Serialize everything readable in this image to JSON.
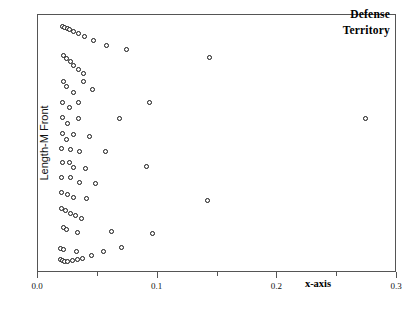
{
  "chart_data": {
    "type": "scatter",
    "title": "",
    "annotation_lines": [
      "Defense",
      "Territory"
    ],
    "xlabel": "x-axis",
    "ylabel": "Length-M Front",
    "xlim": [
      0.0,
      0.3
    ],
    "ylim": [
      0.0,
      1.0
    ],
    "grid": false,
    "legend": null,
    "x_ticks": [
      {
        "value": 0.0,
        "label": "0.0",
        "type": "major"
      },
      {
        "value": 0.05,
        "label": "",
        "type": "minor"
      },
      {
        "value": 0.1,
        "label": "0.1",
        "type": "major"
      },
      {
        "value": 0.15,
        "label": "",
        "type": "minor"
      },
      {
        "value": 0.2,
        "label": "0.2",
        "type": "major"
      },
      {
        "value": 0.25,
        "label": "",
        "type": "minor"
      },
      {
        "value": 0.3,
        "label": "0.3",
        "type": "major"
      }
    ],
    "y_ticks": [],
    "marker": {
      "shape": "circle-open",
      "size_px": 5,
      "edge_color": "#141414",
      "face_color": "#ffffff"
    },
    "points": [
      {
        "x": 0.0205,
        "y": 0.955
      },
      {
        "x": 0.0225,
        "y": 0.951
      },
      {
        "x": 0.0245,
        "y": 0.947
      },
      {
        "x": 0.0265,
        "y": 0.943
      },
      {
        "x": 0.0295,
        "y": 0.936
      },
      {
        "x": 0.0335,
        "y": 0.928
      },
      {
        "x": 0.0385,
        "y": 0.916
      },
      {
        "x": 0.0465,
        "y": 0.9
      },
      {
        "x": 0.057,
        "y": 0.881
      },
      {
        "x": 0.074,
        "y": 0.866
      },
      {
        "x": 0.0215,
        "y": 0.842
      },
      {
        "x": 0.024,
        "y": 0.83
      },
      {
        "x": 0.027,
        "y": 0.818
      },
      {
        "x": 0.03,
        "y": 0.804
      },
      {
        "x": 0.034,
        "y": 0.79
      },
      {
        "x": 0.038,
        "y": 0.775
      },
      {
        "x": 0.1435,
        "y": 0.836
      },
      {
        "x": 0.0215,
        "y": 0.744
      },
      {
        "x": 0.038,
        "y": 0.744
      },
      {
        "x": 0.024,
        "y": 0.722
      },
      {
        "x": 0.03,
        "y": 0.7
      },
      {
        "x": 0.0455,
        "y": 0.71
      },
      {
        "x": 0.0205,
        "y": 0.662
      },
      {
        "x": 0.034,
        "y": 0.661
      },
      {
        "x": 0.0265,
        "y": 0.64
      },
      {
        "x": 0.0935,
        "y": 0.66
      },
      {
        "x": 0.0205,
        "y": 0.602
      },
      {
        "x": 0.0335,
        "y": 0.6
      },
      {
        "x": 0.0245,
        "y": 0.578
      },
      {
        "x": 0.0685,
        "y": 0.6
      },
      {
        "x": 0.274,
        "y": 0.6
      },
      {
        "x": 0.0205,
        "y": 0.54
      },
      {
        "x": 0.03,
        "y": 0.538
      },
      {
        "x": 0.043,
        "y": 0.53
      },
      {
        "x": 0.0235,
        "y": 0.518
      },
      {
        "x": 0.02,
        "y": 0.481
      },
      {
        "x": 0.027,
        "y": 0.478
      },
      {
        "x": 0.035,
        "y": 0.47
      },
      {
        "x": 0.056,
        "y": 0.47
      },
      {
        "x": 0.0205,
        "y": 0.43
      },
      {
        "x": 0.0265,
        "y": 0.428
      },
      {
        "x": 0.03,
        "y": 0.408
      },
      {
        "x": 0.04,
        "y": 0.405
      },
      {
        "x": 0.0905,
        "y": 0.412
      },
      {
        "x": 0.02,
        "y": 0.372
      },
      {
        "x": 0.0275,
        "y": 0.37
      },
      {
        "x": 0.0345,
        "y": 0.35
      },
      {
        "x": 0.048,
        "y": 0.348
      },
      {
        "x": 0.0195,
        "y": 0.312
      },
      {
        "x": 0.025,
        "y": 0.306
      },
      {
        "x": 0.03,
        "y": 0.292
      },
      {
        "x": 0.0405,
        "y": 0.288
      },
      {
        "x": 0.142,
        "y": 0.282
      },
      {
        "x": 0.0195,
        "y": 0.25
      },
      {
        "x": 0.023,
        "y": 0.243
      },
      {
        "x": 0.027,
        "y": 0.232
      },
      {
        "x": 0.031,
        "y": 0.222
      },
      {
        "x": 0.036,
        "y": 0.21
      },
      {
        "x": 0.021,
        "y": 0.176
      },
      {
        "x": 0.024,
        "y": 0.17
      },
      {
        "x": 0.033,
        "y": 0.158
      },
      {
        "x": 0.0615,
        "y": 0.16
      },
      {
        "x": 0.0955,
        "y": 0.153
      },
      {
        "x": 0.0185,
        "y": 0.094
      },
      {
        "x": 0.0215,
        "y": 0.09
      },
      {
        "x": 0.0325,
        "y": 0.082
      },
      {
        "x": 0.07,
        "y": 0.098
      },
      {
        "x": 0.019,
        "y": 0.053
      },
      {
        "x": 0.0205,
        "y": 0.048
      },
      {
        "x": 0.0225,
        "y": 0.046
      },
      {
        "x": 0.025,
        "y": 0.045
      },
      {
        "x": 0.0285,
        "y": 0.049
      },
      {
        "x": 0.033,
        "y": 0.053
      },
      {
        "x": 0.0375,
        "y": 0.058
      },
      {
        "x": 0.0445,
        "y": 0.068
      },
      {
        "x": 0.0545,
        "y": 0.082
      }
    ]
  }
}
